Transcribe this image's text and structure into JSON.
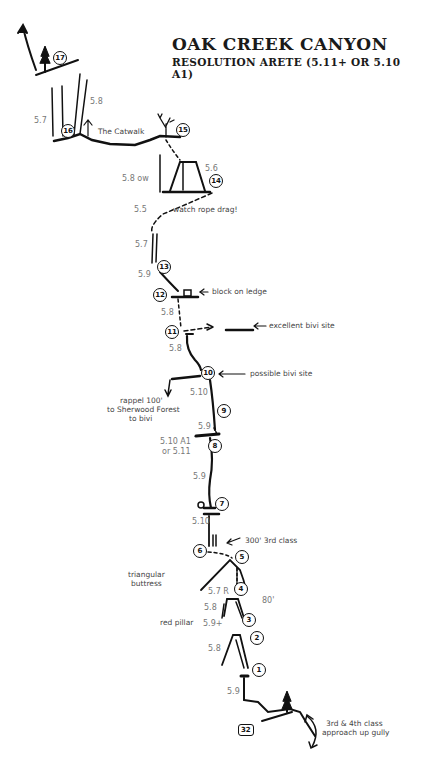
{
  "header": {
    "title": "OAK CREEK CANYON",
    "subtitle": "RESOLUTION ARETE (5.11+ OR 5.10 A1)"
  },
  "belays": [
    {
      "id": "17",
      "x": 60,
      "y": 58
    },
    {
      "id": "16",
      "x": 68,
      "y": 131
    },
    {
      "id": "15",
      "x": 183,
      "y": 130
    },
    {
      "id": "14",
      "x": 216,
      "y": 181
    },
    {
      "id": "13",
      "x": 164,
      "y": 267
    },
    {
      "id": "12",
      "x": 160,
      "y": 295
    },
    {
      "id": "11",
      "x": 172,
      "y": 332
    },
    {
      "id": "10",
      "x": 208,
      "y": 373
    },
    {
      "id": "9",
      "x": 224,
      "y": 411
    },
    {
      "id": "8",
      "x": 215,
      "y": 446
    },
    {
      "id": "7",
      "x": 222,
      "y": 504
    },
    {
      "id": "6",
      "x": 200,
      "y": 551
    },
    {
      "id": "5",
      "x": 242,
      "y": 557
    },
    {
      "id": "4",
      "x": 241,
      "y": 589
    },
    {
      "id": "3",
      "x": 249,
      "y": 620
    },
    {
      "id": "2",
      "x": 257,
      "y": 638
    },
    {
      "id": "1",
      "x": 259,
      "y": 670
    }
  ],
  "start_marker": {
    "id": "32",
    "x": 238,
    "y": 724
  },
  "grades": [
    {
      "text": "5.7",
      "x": 34,
      "y": 116
    },
    {
      "text": "5.8",
      "x": 90,
      "y": 97
    },
    {
      "text": "5.6",
      "x": 205,
      "y": 164
    },
    {
      "text": "5.8  ow",
      "x": 122,
      "y": 174
    },
    {
      "text": "5.5",
      "x": 134,
      "y": 205
    },
    {
      "text": "5.7",
      "x": 135,
      "y": 240
    },
    {
      "text": "5.9",
      "x": 138,
      "y": 270
    },
    {
      "text": "5.8",
      "x": 161,
      "y": 308
    },
    {
      "text": "5.8",
      "x": 169,
      "y": 344
    },
    {
      "text": "5.10",
      "x": 190,
      "y": 388
    },
    {
      "text": "5.9",
      "x": 198,
      "y": 422
    },
    {
      "text": "5.10 A1",
      "x": 160,
      "y": 437
    },
    {
      "text": "or 5.11",
      "x": 162,
      "y": 447
    },
    {
      "text": "5.9",
      "x": 193,
      "y": 472
    },
    {
      "text": "5.10",
      "x": 192,
      "y": 517
    },
    {
      "text": "5.7 R",
      "x": 208,
      "y": 587
    },
    {
      "text": "5.8",
      "x": 204,
      "y": 603
    },
    {
      "text": "5.9+",
      "x": 203,
      "y": 619
    },
    {
      "text": "5.8",
      "x": 208,
      "y": 644
    },
    {
      "text": "80'",
      "x": 262,
      "y": 596
    },
    {
      "text": "5.9",
      "x": 227,
      "y": 687
    }
  ],
  "notes": [
    {
      "text": "The Catwalk",
      "x": 98,
      "y": 130
    },
    {
      "text": "watch rope drag!",
      "x": 173,
      "y": 207
    },
    {
      "text": "block on ledge",
      "x": 212,
      "y": 289
    },
    {
      "text": "excellent bivi site",
      "x": 269,
      "y": 322
    },
    {
      "text": "possible bivi site",
      "x": 250,
      "y": 370
    },
    {
      "text": "rappel 100'",
      "x": 120,
      "y": 396
    },
    {
      "text": "to Sherwood Forest",
      "x": 107,
      "y": 406
    },
    {
      "text": "to bivi",
      "x": 129,
      "y": 416
    },
    {
      "text": "300' 3rd class",
      "x": 245,
      "y": 538
    },
    {
      "text": "triangular",
      "x": 128,
      "y": 570
    },
    {
      "text": "buttress",
      "x": 131,
      "y": 579
    },
    {
      "text": "red pillar",
      "x": 160,
      "y": 619
    },
    {
      "text": "3rd & 4th class",
      "x": 326,
      "y": 721
    },
    {
      "text": "approach up gully",
      "x": 322,
      "y": 730
    }
  ]
}
